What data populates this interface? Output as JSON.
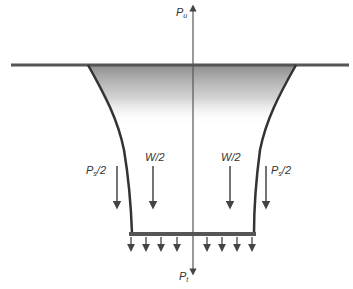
{
  "diagram": {
    "type": "free-body diagram of foundation/anchor (suction caisson style)",
    "labels": {
      "uplift_force": {
        "symbol": "P",
        "subscript": "u"
      },
      "tip_force": {
        "symbol": "P",
        "subscript": "t"
      },
      "side_left": {
        "symbol": "P",
        "subscript": "s",
        "suffix": "/2"
      },
      "side_right": {
        "symbol": "P",
        "subscript": "s",
        "suffix": "/2"
      },
      "weight_left": "W/2",
      "weight_right": "W/2"
    },
    "colors": {
      "line": "#444444",
      "shading": "#888888",
      "background": "#ffffff"
    }
  }
}
